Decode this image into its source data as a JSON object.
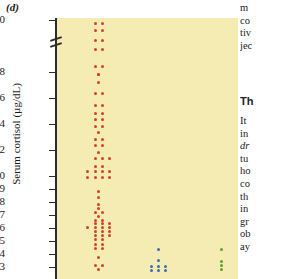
{
  "figure": {
    "panel_label": "(d)",
    "y_axis_title": "Serum cortisol (µg/dL)",
    "plot_bg_color": "#f5ecb3",
    "axis_color": "#2b2b2b"
  },
  "text_column": {
    "paragraph_1": [
      "m",
      "co",
      "tiv",
      "jec"
    ],
    "heading": "Th",
    "paragraph_2": [
      "It",
      "in",
      "dr",
      "tu",
      "ho",
      "co",
      "th",
      "in",
      "gr",
      "ob",
      "ay"
    ],
    "italic_lines": [
      "dr"
    ]
  },
  "chart_data": {
    "type": "scatter",
    "title": "(d)",
    "xlabel": "",
    "ylabel": "Serum cortisol (µg/dL)",
    "ylim": [
      2.6,
      30
    ],
    "y_axis_break": [
      19.5,
      28.5
    ],
    "grid": false,
    "legend_position": "none",
    "tick_labels": [
      "30",
      "18",
      "16",
      "14",
      "12",
      "10",
      "9",
      "8",
      "7",
      "6",
      "5",
      "4",
      "3"
    ],
    "tick_values": [
      30,
      18,
      16,
      14,
      12,
      10,
      9,
      8,
      7,
      6,
      5,
      4,
      3
    ],
    "series": [
      {
        "name": "group-1",
        "color": "#d6402a",
        "x_center": 0.23,
        "values": [
          {
            "y": 29.6,
            "offset": -1
          },
          {
            "y": 29.6,
            "offset": 1
          },
          {
            "y": 28.8,
            "offset": -1
          },
          {
            "y": 28.8,
            "offset": 1
          },
          {
            "y": 27.6,
            "offset": -1
          },
          {
            "y": 27.6,
            "offset": 1
          },
          {
            "y": 26.5,
            "offset": -1
          },
          {
            "y": 26.5,
            "offset": 1
          },
          {
            "y": 23.5,
            "offset": 0
          },
          {
            "y": 18.4,
            "offset": -1
          },
          {
            "y": 18.4,
            "offset": 1
          },
          {
            "y": 17.8,
            "offset": 0
          },
          {
            "y": 17.2,
            "offset": 0
          },
          {
            "y": 16.3,
            "offset": -1
          },
          {
            "y": 16.3,
            "offset": 1
          },
          {
            "y": 15.4,
            "offset": -1
          },
          {
            "y": 15.4,
            "offset": 1
          },
          {
            "y": 14.8,
            "offset": -1
          },
          {
            "y": 14.8,
            "offset": 1
          },
          {
            "y": 14.3,
            "offset": -1
          },
          {
            "y": 14.3,
            "offset": 1
          },
          {
            "y": 13.8,
            "offset": -1
          },
          {
            "y": 13.8,
            "offset": 1
          },
          {
            "y": 13.3,
            "offset": 0
          },
          {
            "y": 12.8,
            "offset": -1
          },
          {
            "y": 12.8,
            "offset": 1
          },
          {
            "y": 12.3,
            "offset": -1
          },
          {
            "y": 12.3,
            "offset": 1
          },
          {
            "y": 11.8,
            "offset": 0
          },
          {
            "y": 11.3,
            "offset": -1
          },
          {
            "y": 11.3,
            "offset": 1
          },
          {
            "y": 11.3,
            "offset": 3
          },
          {
            "y": 10.7,
            "offset": -1
          },
          {
            "y": 10.7,
            "offset": 1
          },
          {
            "y": 10.3,
            "offset": -3
          },
          {
            "y": 10.3,
            "offset": -1
          },
          {
            "y": 10.3,
            "offset": 1
          },
          {
            "y": 10.3,
            "offset": 3
          },
          {
            "y": 9.9,
            "offset": -3
          },
          {
            "y": 9.9,
            "offset": -1
          },
          {
            "y": 9.9,
            "offset": 1
          },
          {
            "y": 9.9,
            "offset": 3
          },
          {
            "y": 8.8,
            "offset": 0
          },
          {
            "y": 8.3,
            "offset": 0
          },
          {
            "y": 7.8,
            "offset": 0
          },
          {
            "y": 7.5,
            "offset": 0
          },
          {
            "y": 7.2,
            "offset": -1
          },
          {
            "y": 7.2,
            "offset": 1
          },
          {
            "y": 6.9,
            "offset": 0
          },
          {
            "y": 6.6,
            "offset": -1
          },
          {
            "y": 6.6,
            "offset": 1
          },
          {
            "y": 6.3,
            "offset": -1
          },
          {
            "y": 6.3,
            "offset": 1
          },
          {
            "y": 6.3,
            "offset": 3
          },
          {
            "y": 6.0,
            "offset": -3
          },
          {
            "y": 6.0,
            "offset": -1
          },
          {
            "y": 6.0,
            "offset": 1
          },
          {
            "y": 6.0,
            "offset": 3
          },
          {
            "y": 5.7,
            "offset": -1
          },
          {
            "y": 5.7,
            "offset": 1
          },
          {
            "y": 5.7,
            "offset": 3
          },
          {
            "y": 5.4,
            "offset": -1
          },
          {
            "y": 5.4,
            "offset": 1
          },
          {
            "y": 5.4,
            "offset": 3
          },
          {
            "y": 5.1,
            "offset": -1
          },
          {
            "y": 5.1,
            "offset": 1
          },
          {
            "y": 4.7,
            "offset": -1
          },
          {
            "y": 4.7,
            "offset": 1
          },
          {
            "y": 4.4,
            "offset": -1
          },
          {
            "y": 4.4,
            "offset": 1
          },
          {
            "y": 3.7,
            "offset": 0
          },
          {
            "y": 3.1,
            "offset": -1
          },
          {
            "y": 3.1,
            "offset": 1
          },
          {
            "y": 2.8,
            "offset": 0
          }
        ]
      },
      {
        "name": "group-2",
        "color": "#3a6fb0",
        "x_center": 0.56,
        "values": [
          {
            "y": 4.3,
            "offset": 0
          },
          {
            "y": 3.5,
            "offset": 0
          },
          {
            "y": 3.0,
            "offset": -2
          },
          {
            "y": 3.0,
            "offset": 0
          },
          {
            "y": 3.0,
            "offset": 2
          },
          {
            "y": 2.7,
            "offset": -2
          },
          {
            "y": 2.7,
            "offset": 0
          },
          {
            "y": 2.7,
            "offset": 2
          }
        ]
      },
      {
        "name": "group-3",
        "color": "#5aa02c",
        "x_center": 0.91,
        "values": [
          {
            "y": 4.3,
            "offset": 0
          },
          {
            "y": 3.4,
            "offset": 0
          },
          {
            "y": 3.1,
            "offset": 0
          },
          {
            "y": 2.8,
            "offset": 0
          }
        ]
      }
    ]
  }
}
